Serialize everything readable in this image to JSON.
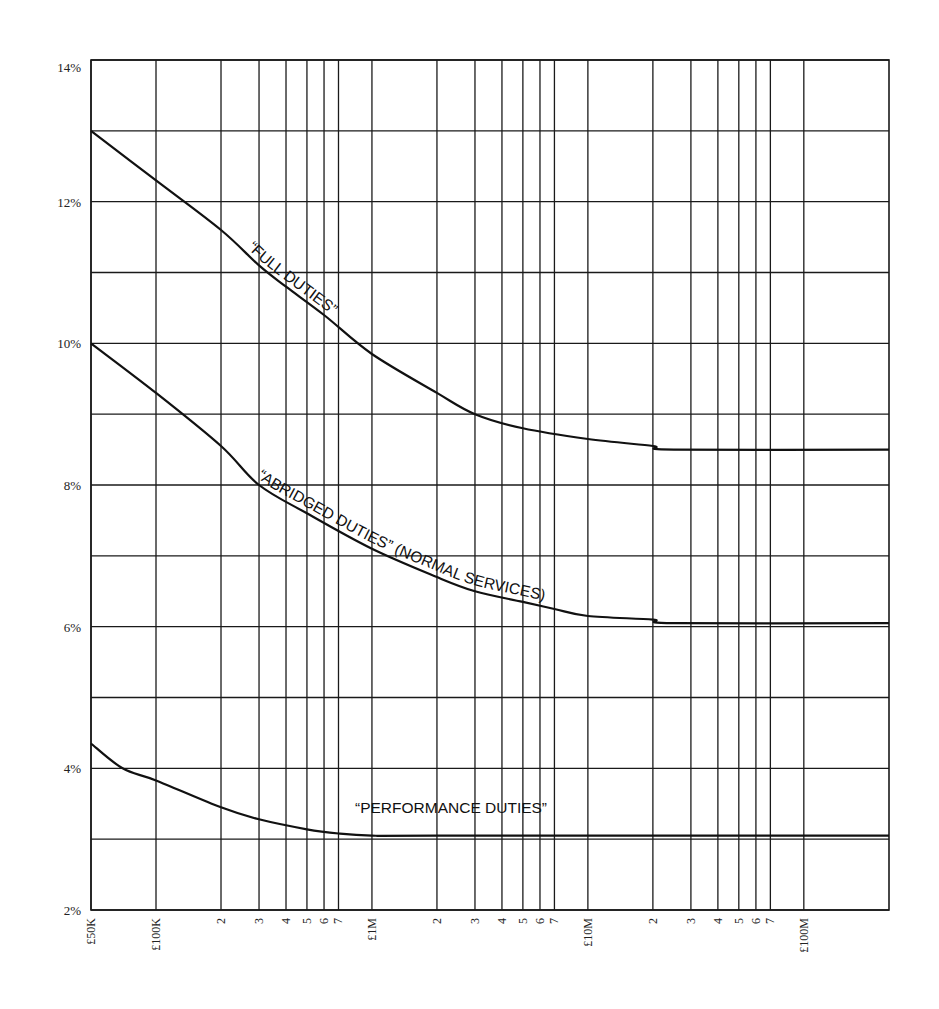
{
  "chart_data": {
    "type": "line",
    "title": "",
    "xlabel": "",
    "ylabel": "",
    "x_scale": "log",
    "xlim": [
      50000,
      248000000
    ],
    "ylim": [
      2,
      14
    ],
    "grid": true,
    "y_ticks": [
      {
        "value": 14,
        "label": "14%"
      },
      {
        "value": 12,
        "label": "12%"
      },
      {
        "value": 10,
        "label": "10%"
      },
      {
        "value": 8,
        "label": "8%"
      },
      {
        "value": 6,
        "label": "6%"
      },
      {
        "value": 4,
        "label": "4%"
      },
      {
        "value": 2,
        "label": "2%"
      }
    ],
    "y_gridlines": [
      2,
      3,
      4,
      5,
      6,
      7,
      8,
      9,
      10,
      11,
      12,
      13,
      14
    ],
    "x_ticks": [
      {
        "value": 50000,
        "label": "£50K"
      },
      {
        "value": 100000,
        "label": "£100K"
      },
      {
        "value": 200000,
        "label": "2"
      },
      {
        "value": 300000,
        "label": "3"
      },
      {
        "value": 400000,
        "label": "4"
      },
      {
        "value": 500000,
        "label": "5"
      },
      {
        "value": 600000,
        "label": "6"
      },
      {
        "value": 700000,
        "label": "7"
      },
      {
        "value": 1000000,
        "label": "£1M"
      },
      {
        "value": 2000000,
        "label": "2"
      },
      {
        "value": 3000000,
        "label": "3"
      },
      {
        "value": 4000000,
        "label": "4"
      },
      {
        "value": 5000000,
        "label": "5"
      },
      {
        "value": 6000000,
        "label": "6"
      },
      {
        "value": 7000000,
        "label": "7"
      },
      {
        "value": 10000000,
        "label": "£10M"
      },
      {
        "value": 20000000,
        "label": "2"
      },
      {
        "value": 30000000,
        "label": "3"
      },
      {
        "value": 40000000,
        "label": "4"
      },
      {
        "value": 50000000,
        "label": "5"
      },
      {
        "value": 60000000,
        "label": "6"
      },
      {
        "value": 70000000,
        "label": "7"
      },
      {
        "value": 100000000,
        "label": "£100M"
      }
    ],
    "series": [
      {
        "name": "“FULL DUTIES”",
        "x": [
          50000,
          100000,
          200000,
          300000,
          400000,
          600000,
          1000000,
          2000000,
          3000000,
          5000000,
          10000000,
          20000000,
          25000000,
          248000000
        ],
        "y": [
          13.0,
          12.3,
          11.6,
          11.1,
          10.8,
          10.4,
          9.85,
          9.3,
          9.0,
          8.8,
          8.65,
          8.55,
          8.5,
          8.5
        ]
      },
      {
        "name": "“ABRIDGED DUTIES” (NORMAL SERVICES)",
        "x": [
          50000,
          100000,
          200000,
          300000,
          500000,
          1000000,
          2000000,
          3000000,
          5000000,
          7000000,
          10000000,
          20000000,
          25000000,
          248000000
        ],
        "y": [
          10.0,
          9.3,
          8.55,
          8.0,
          7.6,
          7.1,
          6.7,
          6.5,
          6.35,
          6.25,
          6.15,
          6.1,
          6.05,
          6.05
        ]
      },
      {
        "name": "“PERFORMANCE DUTIES”",
        "x": [
          50000,
          70000,
          100000,
          200000,
          300000,
          500000,
          700000,
          1000000,
          2000000,
          248000000
        ],
        "y": [
          4.35,
          4.0,
          3.83,
          3.45,
          3.28,
          3.14,
          3.08,
          3.05,
          3.05,
          3.05
        ]
      }
    ],
    "annotations": [
      {
        "text": "“FULL DUTIES”",
        "series": 0,
        "placement": "along-curve"
      },
      {
        "text": "“ABRIDGED DUTIES” (NORMAL SERVICES)",
        "series": 1,
        "placement": "along-curve"
      },
      {
        "text": "“PERFORMANCE DUTIES”",
        "series": 2,
        "placement": "above-curve"
      }
    ]
  }
}
